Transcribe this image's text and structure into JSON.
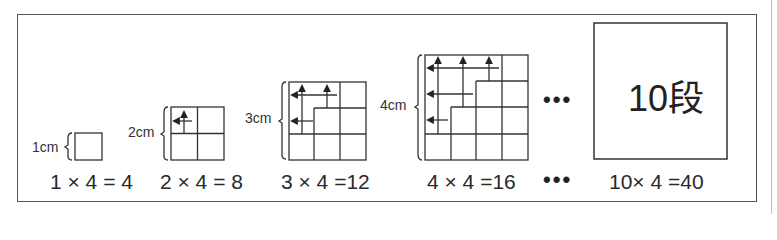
{
  "figure": {
    "steps": [
      {
        "size_label": "1cm",
        "equation": "1 × 4 = 4"
      },
      {
        "size_label": "2cm",
        "equation": "2 × 4 = 8"
      },
      {
        "size_label": "3cm",
        "equation": "3 × 4 =12"
      },
      {
        "size_label": "4cm",
        "equation": "4 × 4 =16"
      }
    ],
    "ellipsis": "•••",
    "final": {
      "label": "10段",
      "equation": "10× 4 =40"
    }
  }
}
